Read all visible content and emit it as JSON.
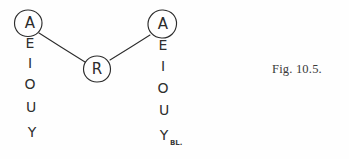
{
  "figure": {
    "caption": "Fig. 10.5.",
    "nodes": [
      {
        "id": "left-a",
        "label": "A",
        "cx": 28,
        "cy": 23,
        "rx": 14,
        "ry": 13
      },
      {
        "id": "center-r",
        "label": "R",
        "cx": 97,
        "cy": 69,
        "rx": 13,
        "ry": 13
      },
      {
        "id": "right-a",
        "label": "A",
        "cx": 162,
        "cy": 24,
        "rx": 15,
        "ry": 14
      }
    ],
    "edges": [
      {
        "id": "edge-left-a-to-r",
        "from": "left-a",
        "to": "center-r",
        "x1": 39,
        "y1": 33,
        "x2": 85,
        "y2": 62
      },
      {
        "id": "edge-r-to-right-a",
        "from": "center-r",
        "to": "right-a",
        "x1": 110,
        "y1": 60,
        "x2": 150,
        "y2": 35
      }
    ],
    "columns": [
      {
        "id": "left-vowel-column",
        "x": 30,
        "letters": [
          {
            "char": "A",
            "y": 23
          },
          {
            "char": "E",
            "y": 43
          },
          {
            "char": "I",
            "y": 63
          },
          {
            "char": "O",
            "y": 84
          },
          {
            "char": "U",
            "y": 107
          },
          {
            "char": "Y",
            "y": 132
          }
        ]
      },
      {
        "id": "right-vowel-column",
        "x": 163,
        "letters": [
          {
            "char": "A",
            "y": 24
          },
          {
            "char": "E",
            "y": 45
          },
          {
            "char": "I",
            "y": 66
          },
          {
            "char": "O",
            "y": 88
          },
          {
            "char": "U",
            "y": 110
          },
          {
            "char": "Y",
            "y": 135
          }
        ]
      }
    ],
    "annotation": {
      "id": "ink-smudge",
      "text": "BL.",
      "x": 170,
      "y": 143
    }
  },
  "colors": {
    "ink": "#2b2b2b",
    "caption": "#3a3a3a",
    "background": "#fefefe"
  }
}
